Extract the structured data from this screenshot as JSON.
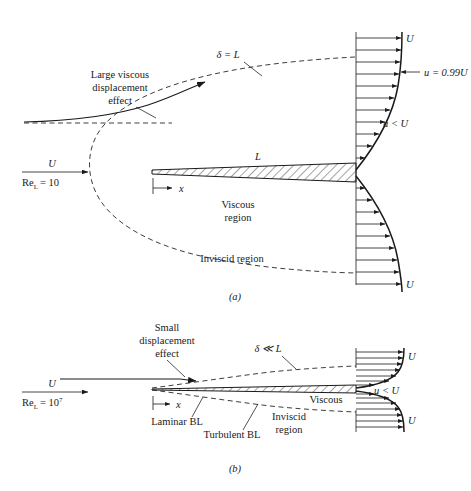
{
  "figure": {
    "type": "technical-diagram",
    "panels": [
      {
        "id": "a",
        "caption": "(a)",
        "reynolds": {
          "velocity_symbol": "U",
          "re_symbol": "Re",
          "re_subscript": "L",
          "equals": "= 10",
          "exponent": ""
        },
        "labels": {
          "displacement_effect_line1": "Large viscous",
          "displacement_effect_line2": "displacement",
          "displacement_effect_line3": "effect",
          "delta": "δ = L",
          "plate_length": "L",
          "x_axis": "x",
          "viscous_line1": "Viscous",
          "viscous_line2": "region",
          "inviscid": "Inviscid region",
          "u_top": "U",
          "u_bottom": "U",
          "u_099": "u = 0.99U",
          "u_less": "u < U"
        }
      },
      {
        "id": "b",
        "caption": "(b)",
        "reynolds": {
          "velocity_symbol": "U",
          "re_symbol": "Re",
          "re_subscript": "L",
          "equals": "= 10",
          "exponent": "7"
        },
        "labels": {
          "displacement_effect_line1": "Small",
          "displacement_effect_line2": "displacement",
          "displacement_effect_line3": "effect",
          "delta": "δ ≪ L",
          "x_axis": "x",
          "laminar": "Laminar BL",
          "turbulent": "Turbulent BL",
          "viscous": "Viscous",
          "inviscid_line1": "Inviscid",
          "inviscid_line2": "region",
          "u_top": "U",
          "u_bottom": "U",
          "u_less": "u < U"
        }
      }
    ]
  },
  "style": {
    "ink": "#1a1a1a",
    "background": "#ffffff"
  }
}
